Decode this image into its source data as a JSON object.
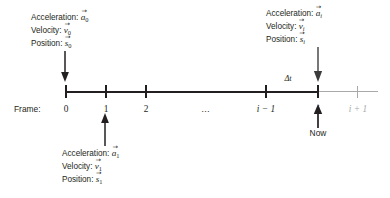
{
  "diagram": {
    "colors": {
      "ink": "#231f20",
      "future_gray": "#a9a9a9"
    },
    "axis": {
      "frame_label": "Frame:",
      "ticks": [
        {
          "label": "0",
          "italic": false,
          "gray": false
        },
        {
          "label": "1",
          "italic": false,
          "gray": false
        },
        {
          "label": "2",
          "italic": false,
          "gray": false
        },
        {
          "label": "…",
          "italic": false,
          "gray": false
        },
        {
          "label": "i − 1",
          "italic": true,
          "gray": false
        },
        {
          "label": "i",
          "italic": true,
          "gray": false
        },
        {
          "label": "i + 1",
          "italic": true,
          "gray": true
        }
      ],
      "interval_label": "Δt"
    },
    "now_marker": {
      "label": "Now"
    },
    "annotations": {
      "frame0": {
        "acceleration_label": "Acceleration:",
        "velocity_label": "Velocity:",
        "position_label": "Position:",
        "acceleration_symbol": "a",
        "velocity_symbol": "v",
        "position_symbol": "s",
        "subscript": "0",
        "subscript_italic": false
      },
      "frame1": {
        "acceleration_label": "Acceleration:",
        "velocity_label": "Velocity:",
        "position_label": "Position:",
        "acceleration_symbol": "a",
        "velocity_symbol": "v",
        "position_symbol": "s",
        "subscript": "1",
        "subscript_italic": false
      },
      "framei": {
        "acceleration_label": "Acceleration:",
        "velocity_label": "Velocity:",
        "position_label": "Position:",
        "acceleration_symbol": "a",
        "velocity_symbol": "v",
        "position_symbol": "s",
        "subscript": "i",
        "subscript_italic": true
      }
    },
    "vector_accent": "→"
  }
}
